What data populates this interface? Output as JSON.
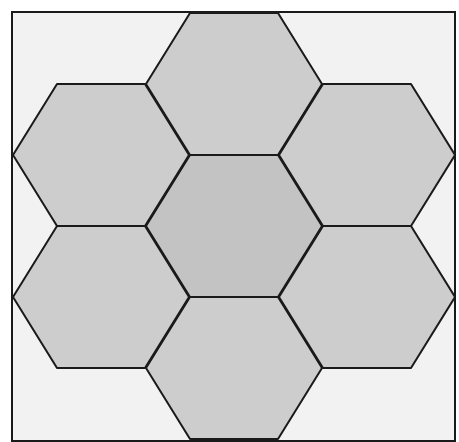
{
  "diagram": {
    "type": "hexagon-tiling",
    "colors": {
      "background": "#ffffff",
      "outer_fill": "#f2f2f2",
      "ring_fill": "#cdcdcd",
      "center_fill": "#c3c3c3",
      "stroke": "#1a1a1a"
    },
    "frame": {
      "x": 12,
      "y": 12,
      "width": 443,
      "height": 429
    },
    "hexagons": [
      {
        "id": "center",
        "cx": 234,
        "cy": 226,
        "fill": "center_fill"
      },
      {
        "id": "top",
        "cx": 234,
        "cy": 84,
        "fill": "ring_fill"
      },
      {
        "id": "bottom",
        "cx": 234,
        "cy": 368,
        "fill": "ring_fill"
      },
      {
        "id": "upper-left",
        "cx": 101,
        "cy": 155,
        "fill": "ring_fill"
      },
      {
        "id": "lower-left",
        "cx": 101,
        "cy": 297,
        "fill": "ring_fill"
      },
      {
        "id": "upper-right",
        "cx": 367,
        "cy": 155,
        "fill": "ring_fill"
      },
      {
        "id": "lower-right",
        "cx": 367,
        "cy": 297,
        "fill": "ring_fill"
      }
    ],
    "hex_half_width": 88,
    "hex_half_height": 71,
    "hex_top_half_edge": 44
  }
}
